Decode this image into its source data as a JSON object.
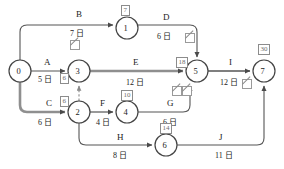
{
  "diagram": {
    "unit_suffix": "日",
    "colors": {
      "node_stroke": "#444444",
      "edge": "#555555",
      "critical_edge": "#8f8f8f",
      "box_stroke": "#8c8c8c",
      "box_text": "#6e6e6e",
      "text": "#1c1c1c",
      "background": "#ffffff"
    },
    "nodes": [
      {
        "id": "n0",
        "label": "0",
        "x": 20,
        "y": 71,
        "r": 11,
        "box": null
      },
      {
        "id": "n1",
        "label": "1",
        "x": 127,
        "y": 28,
        "r": 11,
        "box": "7"
      },
      {
        "id": "n3",
        "label": "3",
        "x": 79,
        "y": 71,
        "r": 11,
        "box": "6"
      },
      {
        "id": "n2",
        "label": "2",
        "x": 79,
        "y": 112,
        "r": 11,
        "box": "6"
      },
      {
        "id": "n4",
        "label": "4",
        "x": 127,
        "y": 112,
        "r": 11,
        "box": "10"
      },
      {
        "id": "n5",
        "label": "5",
        "x": 197,
        "y": 71,
        "r": 11,
        "box": "18"
      },
      {
        "id": "n6",
        "label": "6",
        "x": 166,
        "y": 145,
        "r": 11,
        "box": "14"
      },
      {
        "id": "n7",
        "label": "7",
        "x": 264,
        "y": 71,
        "r": 11,
        "box": "30"
      }
    ],
    "activities": [
      {
        "id": "A",
        "name": "A",
        "duration": "5 日",
        "from": "0",
        "to": "3"
      },
      {
        "id": "B",
        "name": "B",
        "duration": "7 日",
        "from": "0",
        "to": "1"
      },
      {
        "id": "C",
        "name": "C",
        "duration": "6 日",
        "from": "0",
        "to": "2"
      },
      {
        "id": "D",
        "name": "D",
        "duration": "6 日",
        "from": "1",
        "to": "5"
      },
      {
        "id": "E",
        "name": "E",
        "duration": "12 日",
        "from": "3",
        "to": "5"
      },
      {
        "id": "F",
        "name": "F",
        "duration": "4 日",
        "from": "2",
        "to": "4"
      },
      {
        "id": "G",
        "name": "G",
        "duration": "6 日",
        "from": "4",
        "to": "5"
      },
      {
        "id": "H",
        "name": "H",
        "duration": "8 日",
        "from": "2",
        "to": "6"
      },
      {
        "id": "I",
        "name": "I",
        "duration": "12 日",
        "from": "5",
        "to": "7"
      },
      {
        "id": "J",
        "name": "J",
        "duration": "11 日",
        "from": "6",
        "to": "7"
      }
    ],
    "node_boxes": [
      {
        "for": "1",
        "value": "7"
      },
      {
        "for": "3",
        "value": "6"
      },
      {
        "for": "2",
        "value": "6"
      },
      {
        "for": "4",
        "value": "10"
      },
      {
        "for": "5",
        "value": "18"
      },
      {
        "for": "6",
        "value": "14"
      },
      {
        "for": "7",
        "value": "30"
      }
    ],
    "slack_marks": [
      {
        "id": "slack-b",
        "near": "B"
      },
      {
        "id": "slack-d",
        "near": "D"
      },
      {
        "id": "slack-g",
        "near": "G"
      },
      {
        "id": "slack-j",
        "near": "J"
      }
    ]
  }
}
